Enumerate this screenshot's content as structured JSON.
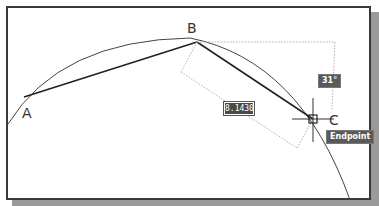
{
  "drawing": {
    "points": [
      {
        "label": "A",
        "x": 24,
        "y": 97
      },
      {
        "label": "B",
        "x": 197,
        "y": 42
      },
      {
        "label": "C",
        "x": 313,
        "y": 119
      }
    ],
    "dimension_input": {
      "value": "8.1430"
    },
    "angle_tooltip": {
      "value": "31°"
    },
    "osnap_tooltip": {
      "value": "Endpoint"
    }
  },
  "colors": {
    "frame": "#3a3a3a",
    "shadow": "#9a9a9a",
    "tooltip_bg": "#5a5a5a",
    "line": "#333333",
    "tracking": "#b0b0b0"
  }
}
